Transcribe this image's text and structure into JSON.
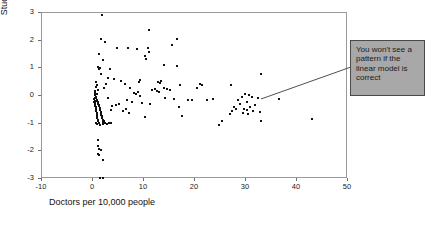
{
  "figure": {
    "title_remnant": "",
    "callout": {
      "text": "You won't see a pattern if the linear model is correct",
      "bg_color": "#a8a8a8",
      "border_color": "#4a4a4a"
    }
  },
  "chart_data": {
    "type": "scatter",
    "title": "",
    "xlabel": "Doctors per 10,000 people",
    "ylabel": "Studentized Deleted Residual",
    "xlim": [
      -10,
      50
    ],
    "ylim": [
      -3,
      3
    ],
    "xticks": [
      -10,
      0,
      10,
      20,
      30,
      40,
      50
    ],
    "yticks": [
      -3,
      -2,
      -1,
      0,
      1,
      2,
      3
    ],
    "xtick_labels": [
      "-10",
      "0",
      "10",
      "20",
      "30",
      "40",
      "50"
    ],
    "ytick_labels": [
      "-3",
      "-2",
      "-1",
      "0",
      "1",
      "2",
      "3"
    ],
    "grid": false,
    "legend": null,
    "marker_color": "#111111",
    "marker_size": 2,
    "annotations": [
      {
        "text": "You won't see a pattern if the linear model is correct",
        "type": "callout-box",
        "leader_from": [
          33.8,
          0.32
        ],
        "leader_to": [
          0.9,
          -0.05
        ]
      }
    ],
    "points": [
      [
        1.7,
        2.93
      ],
      [
        1.5,
        2.05
      ],
      [
        10.9,
        2.4
      ],
      [
        2.3,
        1.94
      ],
      [
        16.4,
        2.06
      ],
      [
        4.8,
        1.72
      ],
      [
        6.9,
        1.74
      ],
      [
        8.6,
        1.7
      ],
      [
        10.7,
        1.73
      ],
      [
        11.0,
        1.58
      ],
      [
        1.2,
        1.52
      ],
      [
        1.9,
        1.3
      ],
      [
        15.4,
        1.84
      ],
      [
        14.0,
        1.13
      ],
      [
        16.5,
        1.1
      ],
      [
        0.9,
        1.05
      ],
      [
        1.3,
        1.03
      ],
      [
        1.15,
        0.96
      ],
      [
        10.2,
        1.45
      ],
      [
        10.4,
        1.32
      ],
      [
        1.6,
        0.79
      ],
      [
        3.3,
        0.96
      ],
      [
        13.4,
        0.55
      ],
      [
        9.3,
        0.57
      ],
      [
        9.0,
        0.52
      ],
      [
        3.0,
        0.66
      ],
      [
        4.2,
        0.62
      ],
      [
        5.5,
        0.53
      ],
      [
        12.8,
        0.52
      ],
      [
        13.1,
        0.48
      ],
      [
        0.6,
        0.49
      ],
      [
        0.8,
        0.41
      ],
      [
        2.6,
        0.45
      ],
      [
        6.2,
        0.44
      ],
      [
        13.9,
        0.29
      ],
      [
        0.5,
        0.33
      ],
      [
        2.1,
        0.3
      ],
      [
        7.3,
        0.28
      ],
      [
        14.6,
        0.25
      ],
      [
        15.1,
        0.22
      ],
      [
        0.45,
        0.18
      ],
      [
        1.0,
        0.2
      ],
      [
        8.1,
        0.12
      ],
      [
        17.1,
        0.4
      ],
      [
        20.9,
        0.43
      ],
      [
        0.4,
        0.1
      ],
      [
        0.7,
        0.07
      ],
      [
        8.4,
        0.07
      ],
      [
        20.3,
        0.3
      ],
      [
        21.4,
        0.38
      ],
      [
        0.35,
        0.02
      ],
      [
        0.55,
        -0.02
      ],
      [
        8.9,
        0.16
      ],
      [
        27.0,
        0.38
      ],
      [
        29.9,
        0.07
      ],
      [
        0.3,
        -0.06
      ],
      [
        0.65,
        -0.09
      ],
      [
        9.2,
        0.0
      ],
      [
        30.6,
        0.02
      ],
      [
        31.1,
        -0.05
      ],
      [
        0.28,
        -0.12
      ],
      [
        0.75,
        -0.14
      ],
      [
        9.6,
        -0.27
      ],
      [
        29.2,
        -0.02
      ],
      [
        32.4,
        -0.07
      ],
      [
        0.32,
        -0.17
      ],
      [
        0.85,
        -0.19
      ],
      [
        11.6,
        0.22
      ],
      [
        28.4,
        -0.14
      ],
      [
        30.2,
        -0.21
      ],
      [
        0.26,
        -0.22
      ],
      [
        0.95,
        -0.23
      ],
      [
        12.1,
        0.24
      ],
      [
        28.9,
        -0.3
      ],
      [
        31.7,
        -0.33
      ],
      [
        0.38,
        -0.26
      ],
      [
        1.05,
        -0.28
      ],
      [
        12.5,
        0.19
      ],
      [
        27.6,
        -0.38
      ],
      [
        30.8,
        -0.4
      ],
      [
        0.42,
        -0.31
      ],
      [
        1.12,
        -0.33
      ],
      [
        13.0,
        0.13
      ],
      [
        28.1,
        -0.46
      ],
      [
        29.6,
        -0.48
      ],
      [
        0.48,
        -0.35
      ],
      [
        1.2,
        -0.37
      ],
      [
        14.2,
        -0.07
      ],
      [
        27.2,
        -0.55
      ],
      [
        30.1,
        -0.52
      ],
      [
        0.52,
        -0.4
      ],
      [
        1.28,
        -0.42
      ],
      [
        15.8,
        -0.1
      ],
      [
        26.8,
        -0.64
      ],
      [
        31.3,
        -0.56
      ],
      [
        0.58,
        -0.45
      ],
      [
        1.35,
        -0.47
      ],
      [
        16.8,
        -0.38
      ],
      [
        29.4,
        -0.6
      ],
      [
        32.7,
        -0.59
      ],
      [
        0.62,
        -0.5
      ],
      [
        1.42,
        -0.52
      ],
      [
        17.4,
        -0.74
      ],
      [
        30.4,
        -0.66
      ],
      [
        32.9,
        -0.92
      ],
      [
        0.68,
        -0.55
      ],
      [
        1.5,
        -0.57
      ],
      [
        18.6,
        -0.14
      ],
      [
        24.8,
        -1.05
      ],
      [
        36.4,
        -0.1
      ],
      [
        0.72,
        -0.6
      ],
      [
        1.58,
        -0.62
      ],
      [
        19.4,
        -0.16
      ],
      [
        25.2,
        -0.9
      ],
      [
        43.0,
        -0.84
      ],
      [
        0.78,
        -0.66
      ],
      [
        1.66,
        -0.68
      ],
      [
        22.3,
        -0.14
      ],
      [
        23.6,
        -0.12
      ],
      [
        32.9,
        0.78
      ],
      [
        0.82,
        -0.72
      ],
      [
        1.74,
        -0.74
      ],
      [
        6.6,
        -0.16
      ],
      [
        7.6,
        -0.22
      ],
      [
        5.1,
        -0.28
      ],
      [
        0.88,
        -0.78
      ],
      [
        1.82,
        -0.8
      ],
      [
        4.6,
        -0.32
      ],
      [
        3.8,
        -0.35
      ],
      [
        2.9,
        -0.08
      ],
      [
        0.92,
        -0.85
      ],
      [
        1.9,
        -0.86
      ],
      [
        5.9,
        -0.54
      ],
      [
        6.4,
        -0.48
      ],
      [
        3.5,
        -0.52
      ],
      [
        0.96,
        -0.92
      ],
      [
        1.98,
        -0.94
      ],
      [
        7.1,
        -0.62
      ],
      [
        10.1,
        -0.77
      ],
      [
        11.2,
        -0.28
      ],
      [
        0.55,
        -0.97
      ],
      [
        1.1,
        -0.98
      ],
      [
        2.4,
        -0.96
      ],
      [
        3.1,
        -0.99
      ],
      [
        2.05,
        -1.02
      ],
      [
        0.7,
        -1.02
      ],
      [
        1.4,
        -1.05
      ],
      [
        2.7,
        -1.03
      ],
      [
        3.6,
        -0.97
      ],
      [
        2.2,
        -0.9
      ],
      [
        1.0,
        -1.58
      ],
      [
        1.05,
        -1.82
      ],
      [
        1.12,
        -1.9
      ],
      [
        0.95,
        -2.08
      ],
      [
        1.55,
        -1.95
      ],
      [
        1.25,
        -2.12
      ],
      [
        1.95,
        -2.3
      ],
      [
        1.4,
        -2.98
      ],
      [
        1.9,
        -2.96
      ]
    ]
  }
}
